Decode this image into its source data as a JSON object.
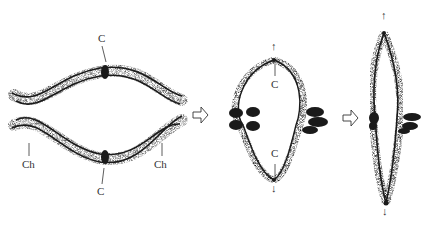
{
  "diagram": {
    "stages": [
      {
        "id": "stage-1",
        "name": "bivalent-with-two-chiasmata",
        "labels": {
          "centromere_top": "C",
          "centromere_bottom": "C",
          "chiasma_left": "Ch",
          "chiasma_right": "Ch"
        }
      },
      {
        "id": "stage-2",
        "name": "ring-bivalent-stretched",
        "labels": {
          "centromere_top": "C",
          "centromere_bottom": "C",
          "arrow_up": "↑",
          "arrow_down": "↓"
        }
      },
      {
        "id": "stage-3",
        "name": "collapsed-rod-bivalent",
        "labels": {
          "arrow_up": "↑",
          "arrow_down": "↓"
        }
      }
    ],
    "transition_arrows": [
      "⇨",
      "⇨"
    ],
    "colors": {
      "ink": "#1a1a1a",
      "stipple": "#555555",
      "label": "#333333",
      "background": "#ffffff"
    }
  }
}
